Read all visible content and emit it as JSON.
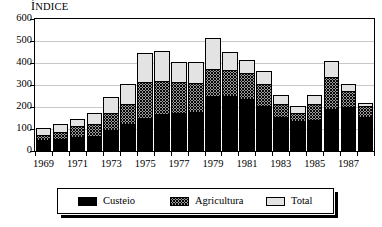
{
  "chart_data": {
    "type": "bar",
    "subtype": "stacked-bar",
    "title": "",
    "ylabel": "ÍNDICE",
    "xlabel": "",
    "ylim": [
      0,
      600
    ],
    "yticks": [
      0,
      100,
      200,
      300,
      400,
      500,
      600
    ],
    "grid": true,
    "grid_axis": "y",
    "legend_position": "bottom",
    "categories": [
      "1969",
      "1970",
      "1971",
      "1972",
      "1973",
      "1974",
      "1975",
      "1976",
      "1977",
      "1978",
      "1979",
      "1980",
      "1981",
      "1982",
      "1983",
      "1984",
      "1985",
      "1986",
      "1987",
      "1988"
    ],
    "xtick_labels": [
      "1969",
      "1971",
      "1973",
      "1975",
      "1977",
      "1979",
      "1981",
      "1983",
      "1985",
      "1987"
    ],
    "xtick_categories": [
      "1969",
      "1971",
      "1973",
      "1975",
      "1977",
      "1979",
      "1981",
      "1983",
      "1985",
      "1987"
    ],
    "series": [
      {
        "name": "Custeio",
        "fill": "solid-black",
        "color": "#000000",
        "values": [
          45,
          50,
          60,
          65,
          90,
          120,
          145,
          165,
          170,
          175,
          245,
          245,
          230,
          200,
          150,
          130,
          135,
          185,
          195,
          150
        ]
      },
      {
        "name": "Agricultura",
        "fill": "crosshatch",
        "color": "#9a9a9a",
        "values": [
          22,
          30,
          48,
          55,
          80,
          90,
          165,
          150,
          140,
          130,
          125,
          120,
          120,
          100,
          60,
          40,
          75,
          145,
          75,
          50
        ]
      },
      {
        "name": "Total",
        "fill": "light-stipple",
        "color": "#e3e3e3",
        "values": [
          32,
          40,
          32,
          48,
          70,
          90,
          130,
          135,
          90,
          95,
          140,
          80,
          60,
          60,
          40,
          30,
          40,
          75,
          30,
          15
        ]
      }
    ],
    "totals": [
      99,
      120,
      140,
      168,
      240,
      300,
      440,
      450,
      400,
      400,
      510,
      445,
      410,
      360,
      250,
      200,
      250,
      405,
      300,
      215
    ],
    "annotations": []
  },
  "legend": {
    "items": [
      {
        "label": "Custeio",
        "swatch": "solid-black-swatch"
      },
      {
        "label": "Agricultura",
        "swatch": "crosshatch-swatch"
      },
      {
        "label": "Total",
        "swatch": "light-stipple-swatch"
      }
    ]
  },
  "axis_title": {
    "first_letter": "Í",
    "rest": "NDICE"
  }
}
